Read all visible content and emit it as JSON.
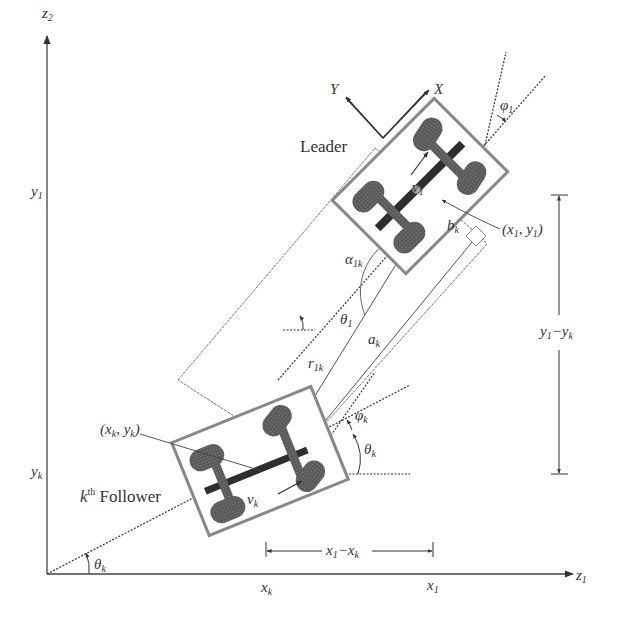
{
  "diagram": {
    "axes": {
      "horizontal": {
        "base": "z",
        "sub": "1"
      },
      "vertical": {
        "base": "z",
        "sub": "2"
      }
    },
    "labels": {
      "leader": "Leader",
      "follower": {
        "prefix": "k",
        "sup": "th",
        "word": "Follower"
      },
      "body_frame_x": "X",
      "body_frame_y": "Y",
      "y1_axis": {
        "base": "y",
        "sub": "1"
      },
      "yk_axis": {
        "base": "y",
        "sub": "k"
      },
      "xk_axis": {
        "base": "x",
        "sub": "k"
      },
      "x1_axis": {
        "base": "x",
        "sub": "1"
      },
      "leader_position": {
        "open": "(",
        "a": "x",
        "a_sub": "1",
        "sep": ",",
        "b": "y",
        "b_sub": "1",
        "close": ")"
      },
      "follower_position": {
        "open": "(",
        "a": "x",
        "a_sub": "k",
        "sep": ",",
        "b": "y",
        "b_sub": "k",
        "close": ")"
      },
      "leader_velocity": {
        "base": "v",
        "sub": "1"
      },
      "follower_velocity": {
        "base": "v",
        "sub": "k"
      },
      "leader_steer": {
        "base": "φ",
        "sub": "1"
      },
      "follower_steer": {
        "base": "φ",
        "sub": "k"
      },
      "leader_heading": {
        "base": "θ",
        "sub": "1"
      },
      "follower_heading_near": {
        "base": "θ",
        "sub": "k"
      },
      "follower_heading_origin": {
        "base": "θ",
        "sub": "k"
      },
      "alpha": {
        "base": "α",
        "sub": "1k"
      },
      "r": {
        "base": "r",
        "sub": "1k"
      },
      "a": {
        "base": "a",
        "sub": "k"
      },
      "b": {
        "base": "b",
        "sub": "k"
      },
      "dy": {
        "a": "y",
        "a_sub": "1",
        "minus": "−",
        "b": "y",
        "b_sub": "k"
      },
      "dx": {
        "a": "x",
        "a_sub": "1",
        "minus": "−",
        "b": "x",
        "b_sub": "k"
      }
    },
    "colors": {
      "line": "#3a3a3a",
      "wheel": "#4a4a4a",
      "frame": "#8a8a8a",
      "text": "#333333"
    }
  }
}
